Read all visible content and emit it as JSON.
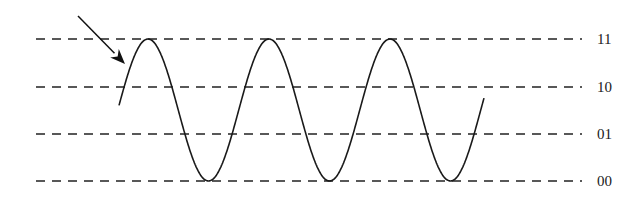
{
  "diagram": {
    "type": "quantization-levels-with-sine-wave",
    "levels": [
      {
        "label": "11",
        "y": 39
      },
      {
        "label": "10",
        "y": 87
      },
      {
        "label": "01",
        "y": 134
      },
      {
        "label": "00",
        "y": 181
      }
    ],
    "dash_line": {
      "x_start": 36,
      "x_end": 582,
      "dash": "9 7",
      "color": "#222222"
    },
    "wave": {
      "color": "#1a1a1a",
      "start": [
        119,
        110
      ],
      "peaks_x": [
        148,
        269,
        390
      ],
      "troughs_x": [
        210,
        330,
        452
      ],
      "end": [
        484,
        108
      ]
    },
    "arrow": {
      "from": [
        78,
        16
      ],
      "to": [
        125,
        64
      ],
      "color": "#111111"
    }
  }
}
